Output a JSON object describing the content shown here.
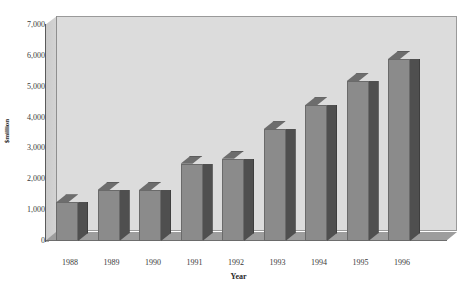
{
  "chart_data": {
    "type": "bar",
    "title": "",
    "xlabel": "Year",
    "ylabel": "$million",
    "categories": [
      "1988",
      "1989",
      "1990",
      "1991",
      "1992",
      "1993",
      "1994",
      "1995",
      "1996"
    ],
    "values": [
      1250,
      1650,
      1650,
      2500,
      2670,
      3620,
      4400,
      5180,
      5900
    ],
    "ylim": [
      0,
      7000
    ],
    "ytick_labels": [
      "0",
      "1,000",
      "2,000",
      "3,000",
      "4,000",
      "5,000",
      "6,000",
      "7,000"
    ],
    "ytick_values": [
      0,
      1000,
      2000,
      3000,
      4000,
      5000,
      6000,
      7000
    ],
    "grid": false,
    "legend": "none",
    "style": "3d-column",
    "colors": {
      "bar_front": "#8b8b8b",
      "bar_side": "#4f4f4f",
      "bar_top": "#6d6d6d",
      "plot_background": "#dcdcdc",
      "floor": "#9d9d9d",
      "left_wall": "#cfcfcf",
      "axis_line": "#5a5a5a",
      "text": "#3a3a3a",
      "page_background": "#ffffff"
    }
  }
}
